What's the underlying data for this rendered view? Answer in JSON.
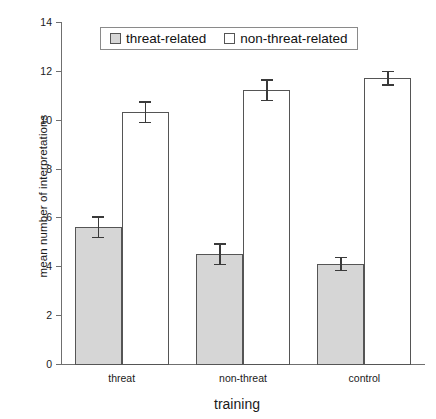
{
  "chart_data": {
    "type": "bar",
    "title": "",
    "xlabel": "training",
    "ylabel": "mean number of interpretations",
    "categories": [
      "threat",
      "non-threat",
      "control"
    ],
    "ylim": [
      0,
      14
    ],
    "yticks": [
      0,
      2,
      4,
      6,
      8,
      10,
      12,
      14
    ],
    "ytick_labels": [
      "0",
      "2",
      "4",
      "6",
      "8",
      "10",
      "12",
      "14"
    ],
    "grid": false,
    "legend_position": "top-center",
    "error_bar_type": "standard error",
    "series": [
      {
        "name": "threat-related",
        "color": "#d6d6d6",
        "values": [
          5.6,
          4.5,
          4.1
        ],
        "errors": [
          0.45,
          0.45,
          0.3
        ]
      },
      {
        "name": "non-threat-related",
        "color": "#ffffff",
        "values": [
          10.3,
          11.2,
          11.7
        ],
        "errors": [
          0.45,
          0.45,
          0.3
        ]
      }
    ]
  },
  "legend": {
    "entries": [
      {
        "label": "threat-related",
        "swatch": "threat"
      },
      {
        "label": "non-threat-related",
        "swatch": "nonthreat"
      }
    ]
  }
}
